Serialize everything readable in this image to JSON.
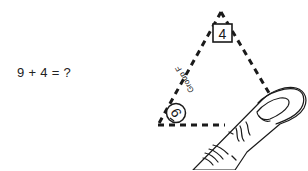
{
  "question": {
    "text": "9 + 4 = ?"
  },
  "diagram": {
    "shape": "triangle",
    "line_style": "dashed",
    "group_label": "Group F",
    "top_vertex_value": "4",
    "top_vertex_marker": "square",
    "bottom_left_vertex_value": "9",
    "bottom_left_vertex_marker": "circle",
    "bottom_right_vertex_value": "",
    "bottom_right_vertex_covered_by": "finger",
    "stroke_color": "#1a1a1a"
  },
  "icons": {
    "finger": "pointing-finger-icon"
  }
}
